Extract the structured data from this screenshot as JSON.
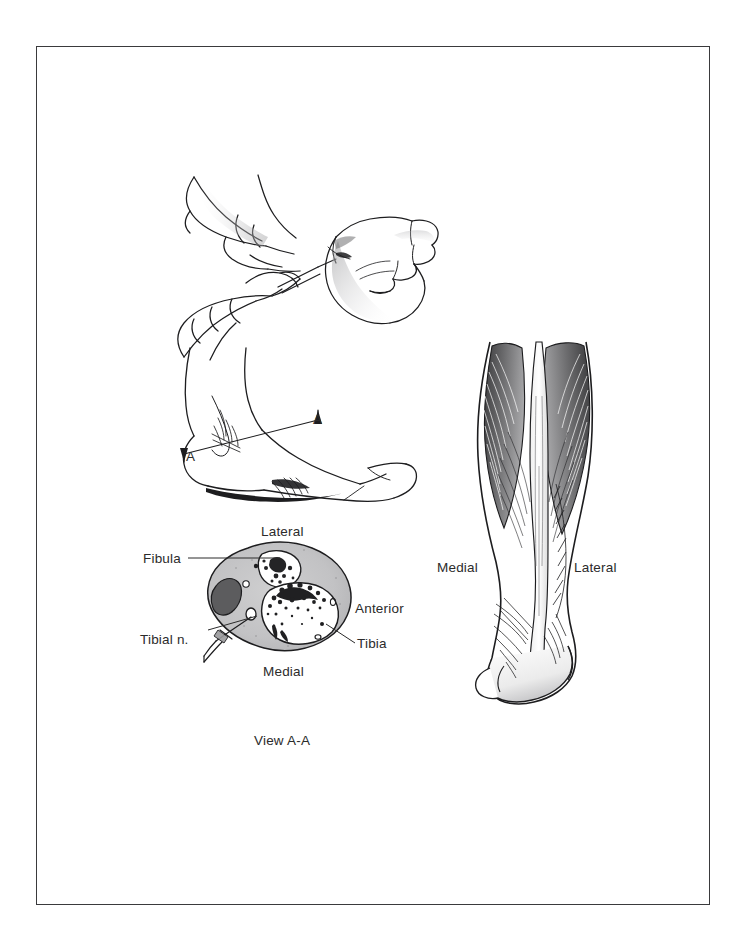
{
  "page": {
    "background": "#ffffff",
    "border_color": "#3a3a3c",
    "ink_color": "#2b2b2b"
  },
  "figure": {
    "panels": [
      {
        "name": "injection-technique",
        "description": "Two hands performing a needle injection at the posterior medial ankle, foot shown in plantar-lateral view with curled toes"
      },
      {
        "name": "lateral-ankle-section-line",
        "description": "Lateral view of foot and ankle with an oblique section plane marked A-A"
      },
      {
        "name": "cross-section-view-a-a",
        "description": "Transverse cross section of the lower leg at the level of the section plane showing tibia, fibula and tibial nerve with needle approach"
      },
      {
        "name": "posterior-calf",
        "description": "Posterior view of calf showing gastrocnemius muscle bellies converging on the calcaneal tendon"
      }
    ]
  },
  "section_markers": {
    "upper_label": "A",
    "lower_label": "A"
  },
  "cross_section": {
    "caption": "View A-A",
    "orientation": {
      "top": "Lateral",
      "bottom": "Medial",
      "right": "Anterior"
    },
    "structures": [
      {
        "label": "Fibula",
        "side": "left",
        "leader": true
      },
      {
        "label": "Tibial n.",
        "side": "left",
        "leader": true
      },
      {
        "label": "Tibia",
        "side": "right",
        "leader": true
      },
      {
        "label": "Anterior",
        "side": "right",
        "leader": false
      }
    ]
  },
  "calf": {
    "orientation": {
      "left": "Medial",
      "right": "Lateral"
    }
  }
}
